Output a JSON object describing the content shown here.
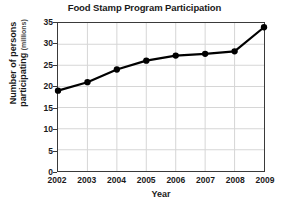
{
  "chart_data": {
    "type": "line",
    "title": "Food Stamp Program Participation",
    "xlabel": "Year",
    "ylabel": "Number of persons participating",
    "ylabel_line1": "Number of persons",
    "ylabel_line2": "participating",
    "yunit": "(millions)",
    "categories": [
      "2002",
      "2003",
      "2004",
      "2005",
      "2006",
      "2007",
      "2008",
      "2009"
    ],
    "x": [
      2002,
      2003,
      2004,
      2005,
      2006,
      2007,
      2008,
      2009
    ],
    "values": [
      19.0,
      21.0,
      24.0,
      26.1,
      27.3,
      27.7,
      28.3,
      34.0
    ],
    "series": [
      {
        "name": "Participation",
        "values": [
          19.0,
          21.0,
          24.0,
          26.1,
          27.3,
          27.7,
          28.3,
          34.0
        ]
      }
    ],
    "ylim": [
      0,
      35
    ],
    "yticks": [
      0,
      5,
      10,
      15,
      20,
      25,
      30,
      35
    ],
    "ytick_labels": [
      "0",
      "5",
      "10",
      "15",
      "20",
      "25",
      "30",
      "35"
    ],
    "xlim": [
      2002,
      2009
    ],
    "grid": true,
    "grid_color": "#d6d6d6",
    "legend": "none",
    "line_color": "#000000",
    "marker": "circle",
    "marker_color": "#000000",
    "axis_color": "#3a3a3a"
  }
}
